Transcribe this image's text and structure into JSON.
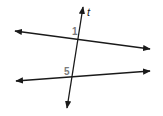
{
  "diagram": {
    "type": "parallel-lines-cut-by-transversal",
    "colors": {
      "line": "#1a1a1a",
      "angle_label": "#7a7a7a",
      "transversal_label": "#1a1a1a",
      "background": "#ffffff"
    },
    "transversal": {
      "label": "t",
      "start": [
        67,
        108
      ],
      "end": [
        83,
        7
      ],
      "arrows": "both"
    },
    "lines": [
      {
        "name": "upper-line",
        "start": [
          15,
          31
        ],
        "end": [
          150,
          49
        ],
        "arrows": "both"
      },
      {
        "name": "lower-line",
        "start": [
          16,
          81
        ],
        "end": [
          150,
          71
        ],
        "arrows": "both"
      }
    ],
    "angle_labels": [
      {
        "text": "1",
        "x": 72,
        "y": 35
      },
      {
        "text": "5",
        "x": 64,
        "y": 75
      }
    ]
  }
}
